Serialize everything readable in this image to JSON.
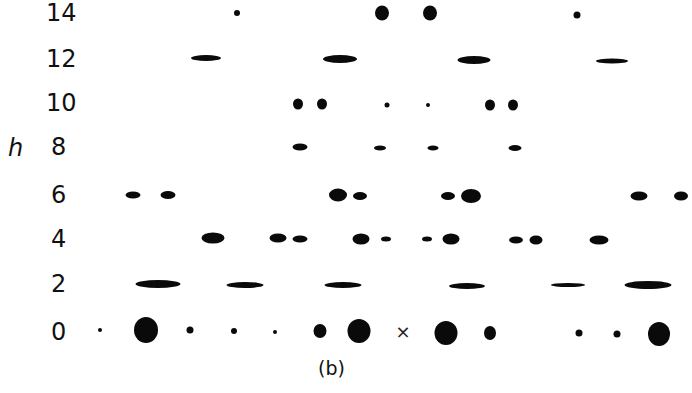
{
  "figure": {
    "caption": "(b)",
    "axis_label": "h",
    "origin_marker": "×",
    "row_labels": [
      {
        "h": "14",
        "y": 13
      },
      {
        "h": "12",
        "y": 59
      },
      {
        "h": "10",
        "y": 103
      },
      {
        "h": "8",
        "y": 147
      },
      {
        "h": "6",
        "y": 195
      },
      {
        "h": "4",
        "y": 239
      },
      {
        "h": "2",
        "y": 284
      },
      {
        "h": "0",
        "y": 332
      }
    ],
    "spots": [
      {
        "row": 14,
        "x": 237,
        "y": 13,
        "w": 6,
        "h": 6
      },
      {
        "row": 14,
        "x": 382,
        "y": 13,
        "w": 14,
        "h": 15
      },
      {
        "row": 14,
        "x": 430,
        "y": 13,
        "w": 14,
        "h": 15
      },
      {
        "row": 14,
        "x": 577,
        "y": 15,
        "w": 7,
        "h": 7
      },
      {
        "row": 12,
        "x": 206,
        "y": 58,
        "w": 30,
        "h": 6
      },
      {
        "row": 12,
        "x": 340,
        "y": 59,
        "w": 34,
        "h": 8
      },
      {
        "row": 12,
        "x": 474,
        "y": 60,
        "w": 33,
        "h": 8
      },
      {
        "row": 12,
        "x": 612,
        "y": 61,
        "w": 32,
        "h": 5
      },
      {
        "row": 10,
        "x": 298,
        "y": 104,
        "w": 10,
        "h": 11
      },
      {
        "row": 10,
        "x": 322,
        "y": 104,
        "w": 10,
        "h": 11
      },
      {
        "row": 10,
        "x": 387,
        "y": 105,
        "w": 5,
        "h": 5
      },
      {
        "row": 10,
        "x": 428,
        "y": 105,
        "w": 4,
        "h": 4
      },
      {
        "row": 10,
        "x": 490,
        "y": 105,
        "w": 10,
        "h": 11
      },
      {
        "row": 10,
        "x": 513,
        "y": 105,
        "w": 10,
        "h": 11
      },
      {
        "row": 8,
        "x": 300,
        "y": 147,
        "w": 15,
        "h": 7
      },
      {
        "row": 8,
        "x": 380,
        "y": 148,
        "w": 12,
        "h": 5
      },
      {
        "row": 8,
        "x": 433,
        "y": 148,
        "w": 11,
        "h": 5
      },
      {
        "row": 8,
        "x": 515,
        "y": 148,
        "w": 13,
        "h": 6
      },
      {
        "row": 6,
        "x": 133,
        "y": 195,
        "w": 15,
        "h": 7
      },
      {
        "row": 6,
        "x": 168,
        "y": 195,
        "w": 15,
        "h": 8
      },
      {
        "row": 6,
        "x": 338,
        "y": 195,
        "w": 18,
        "h": 13
      },
      {
        "row": 6,
        "x": 360,
        "y": 196,
        "w": 14,
        "h": 8
      },
      {
        "row": 6,
        "x": 448,
        "y": 196,
        "w": 14,
        "h": 8
      },
      {
        "row": 6,
        "x": 471,
        "y": 196,
        "w": 20,
        "h": 14
      },
      {
        "row": 6,
        "x": 639,
        "y": 196,
        "w": 17,
        "h": 9
      },
      {
        "row": 6,
        "x": 681,
        "y": 196,
        "w": 14,
        "h": 9
      },
      {
        "row": 4,
        "x": 213,
        "y": 238,
        "w": 23,
        "h": 11
      },
      {
        "row": 4,
        "x": 278,
        "y": 238,
        "w": 17,
        "h": 9
      },
      {
        "row": 4,
        "x": 300,
        "y": 239,
        "w": 15,
        "h": 7
      },
      {
        "row": 4,
        "x": 361,
        "y": 239,
        "w": 17,
        "h": 11
      },
      {
        "row": 4,
        "x": 386,
        "y": 239,
        "w": 10,
        "h": 5
      },
      {
        "row": 4,
        "x": 427,
        "y": 239,
        "w": 10,
        "h": 5
      },
      {
        "row": 4,
        "x": 451,
        "y": 239,
        "w": 17,
        "h": 11
      },
      {
        "row": 4,
        "x": 516,
        "y": 240,
        "w": 14,
        "h": 7
      },
      {
        "row": 4,
        "x": 536,
        "y": 240,
        "w": 13,
        "h": 9
      },
      {
        "row": 4,
        "x": 599,
        "y": 240,
        "w": 19,
        "h": 9
      },
      {
        "row": 2,
        "x": 158,
        "y": 284,
        "w": 45,
        "h": 8
      },
      {
        "row": 2,
        "x": 245,
        "y": 285,
        "w": 37,
        "h": 6
      },
      {
        "row": 2,
        "x": 343,
        "y": 285,
        "w": 37,
        "h": 6
      },
      {
        "row": 2,
        "x": 467,
        "y": 286,
        "w": 36,
        "h": 6
      },
      {
        "row": 2,
        "x": 568,
        "y": 285,
        "w": 34,
        "h": 4
      },
      {
        "row": 2,
        "x": 648,
        "y": 285,
        "w": 47,
        "h": 8
      },
      {
        "row": 0,
        "x": 100,
        "y": 330,
        "w": 4,
        "h": 4
      },
      {
        "row": 0,
        "x": 146,
        "y": 330,
        "w": 24,
        "h": 26
      },
      {
        "row": 0,
        "x": 190,
        "y": 330,
        "w": 7,
        "h": 7
      },
      {
        "row": 0,
        "x": 234,
        "y": 331,
        "w": 6,
        "h": 6
      },
      {
        "row": 0,
        "x": 275,
        "y": 332,
        "w": 4,
        "h": 4
      },
      {
        "row": 0,
        "x": 320,
        "y": 331,
        "w": 13,
        "h": 14
      },
      {
        "row": 0,
        "x": 359,
        "y": 331,
        "w": 23,
        "h": 24
      },
      {
        "row": 0,
        "x": 446,
        "y": 333,
        "w": 23,
        "h": 24
      },
      {
        "row": 0,
        "x": 490,
        "y": 333,
        "w": 12,
        "h": 14
      },
      {
        "row": 0,
        "x": 579,
        "y": 333,
        "w": 7,
        "h": 7
      },
      {
        "row": 0,
        "x": 617,
        "y": 334,
        "w": 7,
        "h": 7
      },
      {
        "row": 0,
        "x": 659,
        "y": 334,
        "w": 22,
        "h": 24
      }
    ],
    "origin": {
      "x": 403,
      "y": 332
    }
  }
}
